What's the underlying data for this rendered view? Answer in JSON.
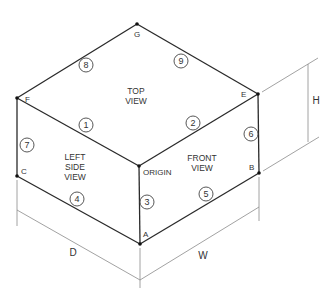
{
  "vertices": {
    "G": "G",
    "F": "F",
    "E": "E",
    "C": "C",
    "B": "B",
    "A": "A",
    "origin": "ORIGIN"
  },
  "faces": {
    "top": [
      "TOP",
      "VIEW"
    ],
    "left": [
      "LEFT",
      "SIDE",
      "VIEW"
    ],
    "front": [
      "FRONT",
      "VIEW"
    ]
  },
  "edge_numbers": [
    "1",
    "2",
    "3",
    "4",
    "5",
    "6",
    "7",
    "8",
    "9"
  ],
  "dimensions": {
    "depth": "D",
    "width": "W",
    "height": "H"
  }
}
